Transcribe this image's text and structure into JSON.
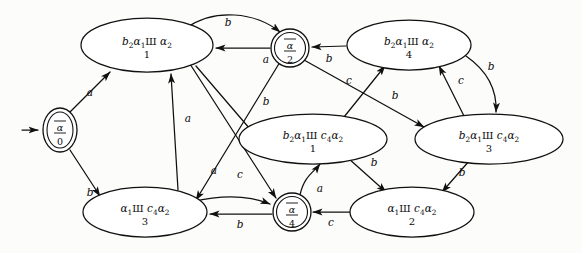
{
  "figure": {
    "type": "finite-automaton-diagram"
  },
  "states": [
    {
      "id": "q0",
      "shape": "double-circle",
      "greek": "α",
      "overline": true,
      "index": "0",
      "cx": 60,
      "cy": 130,
      "rx": 17,
      "ry": 22,
      "initial": true
    },
    {
      "id": "n1",
      "shape": "ellipse",
      "text": "b",
      "sub1": "2",
      "alpha": "α",
      "sub2": "1",
      "shuffle": "Ш",
      "tail": "α",
      "sub3": "2",
      "index": "1",
      "cx": 147,
      "cy": 45,
      "rx": 66,
      "ry": 27
    },
    {
      "id": "q2",
      "shape": "double-circle",
      "greek": "α",
      "overline": true,
      "index": "2",
      "cx": 290,
      "cy": 48,
      "rx": 19,
      "ry": 19
    },
    {
      "id": "n4",
      "shape": "ellipse",
      "text": "b",
      "sub1": "2",
      "alpha": "α",
      "sub2": "1",
      "shuffle": "Ш",
      "tail": "α",
      "sub3": "2",
      "index": "4",
      "cx": 409,
      "cy": 45,
      "rx": 62,
      "ry": 25
    },
    {
      "id": "m1",
      "shape": "ellipse",
      "text": "b",
      "sub1": "2",
      "alpha": "α",
      "sub2": "1",
      "shuffle": "Ш",
      "mid": "c",
      "sub4": "4",
      "tail": "α",
      "sub3": "2",
      "index": "1",
      "cx": 313,
      "cy": 139,
      "rx": 74,
      "ry": 25
    },
    {
      "id": "m3",
      "shape": "ellipse",
      "text": "b",
      "sub1": "2",
      "alpha": "α",
      "sub2": "1",
      "shuffle": "Ш",
      "mid": "c",
      "sub4": "4",
      "tail": "α",
      "sub3": "2",
      "index": "3",
      "cx": 489,
      "cy": 139,
      "rx": 74,
      "ry": 25
    },
    {
      "id": "p3",
      "shape": "ellipse",
      "text": "",
      "alpha": "α",
      "sub2": "1",
      "shuffle": "Ш",
      "mid": "c",
      "sub4": "4",
      "tail": "α",
      "sub3": "2",
      "index": "3",
      "cx": 145,
      "cy": 212,
      "rx": 62,
      "ry": 25
    },
    {
      "id": "q4",
      "shape": "double-circle",
      "greek": "α",
      "overline": true,
      "index": "4",
      "cx": 292,
      "cy": 212,
      "rx": 19,
      "ry": 19
    },
    {
      "id": "p2",
      "shape": "ellipse",
      "text": "",
      "alpha": "α",
      "sub2": "1",
      "shuffle": "Ш",
      "mid": "c",
      "sub4": "4",
      "tail": "α",
      "sub3": "2",
      "index": "2",
      "cx": 412,
      "cy": 212,
      "rx": 62,
      "ry": 25
    }
  ],
  "edge_labels": {
    "q0_to_n1": "a",
    "q0_to_p3": "b",
    "n1_to_q2": "b",
    "q2_to_n1": "a",
    "n4_to_q2": "b",
    "n4_to_m3": "b",
    "m3_to_n4": "c",
    "m1_to_n4": "c",
    "q2_to_m3": "b",
    "q2_to_p3": "a",
    "p3_to_n1": "a",
    "n1_to_q4": "b",
    "p3_to_q4": "c",
    "q4_to_p3": "b",
    "q4_to_m1": "a",
    "p2_to_q4": "c",
    "m1_to_p2": "b",
    "m3_to_p2": "b",
    "n1_to_m1": "b",
    "left_a": "a"
  },
  "alphabet": [
    "a",
    "b",
    "c"
  ],
  "colors": {
    "ink": "#101010",
    "background": "#fcfcfa",
    "node_fill": "#ffffff"
  }
}
